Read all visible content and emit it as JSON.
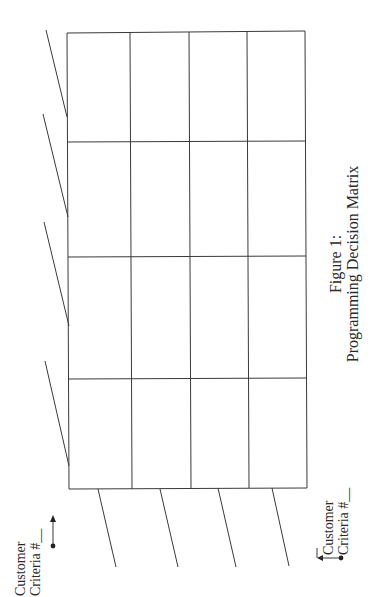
{
  "figure": {
    "caption_line1": "Figure 1:",
    "caption_line2": "Programming Decision Matrix"
  },
  "labels": {
    "top_label_line1": "Customer",
    "top_label_line2": "Criteria #__",
    "bottom_label_line1": "Customer",
    "bottom_label_line2": "Criteria #__"
  },
  "matrix": {
    "rows": 4,
    "columns": 4,
    "cells": [
      [
        "",
        "",
        "",
        ""
      ],
      [
        "",
        "",
        "",
        ""
      ],
      [
        "",
        "",
        "",
        ""
      ],
      [
        "",
        "",
        "",
        ""
      ]
    ]
  },
  "colors": {
    "line": "#3a3a3a",
    "background": "#ffffff"
  }
}
